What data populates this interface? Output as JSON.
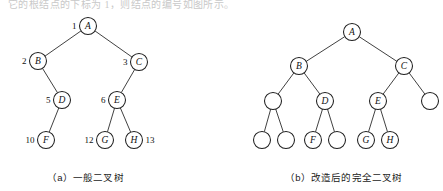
{
  "figure": {
    "top_partial_text": "它的根结点的下标为 1，则结点的编号如图所示。",
    "width": 443,
    "height": 191,
    "ink_color": "#1f1f1f",
    "node_fill": "#ffffff"
  },
  "panels": [
    {
      "id": "panel-a",
      "caption": "（a）一般二叉树",
      "node_radius": 8.5,
      "nodes": [
        {
          "id": "a-A",
          "label": "A",
          "index": "1",
          "index_side": "left",
          "cx": 88,
          "cy": 26,
          "empty": false
        },
        {
          "id": "a-B",
          "label": "B",
          "index": "2",
          "index_side": "left",
          "cx": 38,
          "cy": 61,
          "empty": false
        },
        {
          "id": "a-C",
          "label": "C",
          "index": "3",
          "index_side": "left",
          "cx": 139,
          "cy": 62,
          "empty": false
        },
        {
          "id": "a-D",
          "label": "D",
          "index": "5",
          "index_side": "left",
          "cx": 62,
          "cy": 100,
          "empty": false
        },
        {
          "id": "a-E",
          "label": "E",
          "index": "6",
          "index_side": "left",
          "cx": 117,
          "cy": 100,
          "empty": false
        },
        {
          "id": "a-F",
          "label": "F",
          "index": "10",
          "index_side": "left",
          "cx": 46,
          "cy": 140,
          "empty": false
        },
        {
          "id": "a-G",
          "label": "G",
          "index": "12",
          "index_side": "left",
          "cx": 105,
          "cy": 140,
          "empty": false
        },
        {
          "id": "a-H",
          "label": "H",
          "index": "13",
          "index_side": "right",
          "cx": 134,
          "cy": 140,
          "empty": false
        }
      ],
      "edges": [
        {
          "from": "a-A",
          "to": "a-B"
        },
        {
          "from": "a-A",
          "to": "a-C"
        },
        {
          "from": "a-B",
          "to": "a-D"
        },
        {
          "from": "a-C",
          "to": "a-E"
        },
        {
          "from": "a-D",
          "to": "a-F"
        },
        {
          "from": "a-E",
          "to": "a-G"
        },
        {
          "from": "a-E",
          "to": "a-H"
        }
      ]
    },
    {
      "id": "panel-b",
      "caption": "（b）改造后的完全二叉树",
      "node_radius": 8.5,
      "nodes": [
        {
          "id": "b-A",
          "label": "A",
          "index": "",
          "index_side": "",
          "cx": 352,
          "cy": 32,
          "empty": false
        },
        {
          "id": "b-B",
          "label": "B",
          "index": "",
          "index_side": "",
          "cx": 299,
          "cy": 66,
          "empty": false
        },
        {
          "id": "b-C",
          "label": "C",
          "index": "",
          "index_side": "",
          "cx": 404,
          "cy": 66,
          "empty": false
        },
        {
          "id": "b-n4",
          "label": "",
          "index": "",
          "index_side": "",
          "cx": 273,
          "cy": 101,
          "empty": true
        },
        {
          "id": "b-D",
          "label": "D",
          "index": "",
          "index_side": "",
          "cx": 325,
          "cy": 101,
          "empty": false
        },
        {
          "id": "b-E",
          "label": "E",
          "index": "",
          "index_side": "",
          "cx": 378,
          "cy": 101,
          "empty": false
        },
        {
          "id": "b-n7",
          "label": "",
          "index": "",
          "index_side": "",
          "cx": 430,
          "cy": 101,
          "empty": true
        },
        {
          "id": "b-n8",
          "label": "",
          "index": "",
          "index_side": "",
          "cx": 262,
          "cy": 140,
          "empty": true
        },
        {
          "id": "b-n9",
          "label": "",
          "index": "",
          "index_side": "",
          "cx": 286,
          "cy": 140,
          "empty": true
        },
        {
          "id": "b-F",
          "label": "F",
          "index": "",
          "index_side": "",
          "cx": 313,
          "cy": 140,
          "empty": false
        },
        {
          "id": "b-n11",
          "label": "",
          "index": "",
          "index_side": "",
          "cx": 337,
          "cy": 140,
          "empty": true
        },
        {
          "id": "b-G",
          "label": "G",
          "index": "",
          "index_side": "",
          "cx": 366,
          "cy": 140,
          "empty": false
        },
        {
          "id": "b-H",
          "label": "H",
          "index": "",
          "index_side": "",
          "cx": 390,
          "cy": 140,
          "empty": false
        }
      ],
      "edges": [
        {
          "from": "b-A",
          "to": "b-B"
        },
        {
          "from": "b-A",
          "to": "b-C"
        },
        {
          "from": "b-B",
          "to": "b-n4"
        },
        {
          "from": "b-B",
          "to": "b-D"
        },
        {
          "from": "b-C",
          "to": "b-E"
        },
        {
          "from": "b-C",
          "to": "b-n7"
        },
        {
          "from": "b-n4",
          "to": "b-n8"
        },
        {
          "from": "b-n4",
          "to": "b-n9"
        },
        {
          "from": "b-D",
          "to": "b-F"
        },
        {
          "from": "b-D",
          "to": "b-n11"
        },
        {
          "from": "b-E",
          "to": "b-G"
        },
        {
          "from": "b-E",
          "to": "b-H"
        }
      ]
    }
  ]
}
